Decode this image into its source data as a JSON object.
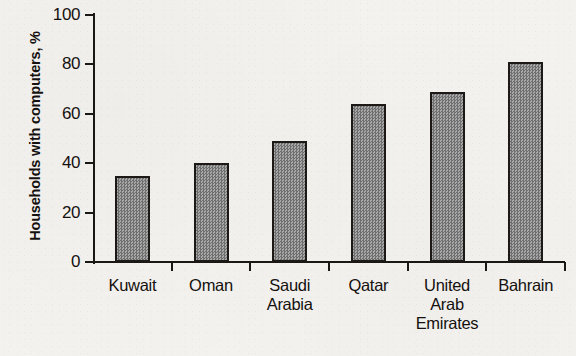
{
  "chart_data": {
    "type": "bar",
    "title": "",
    "xlabel": "",
    "ylabel": "Households with computers, %",
    "categories": [
      "Kuwait",
      "Oman",
      "Saudi Arabia",
      "Qatar",
      "United Arab Emirates",
      "Bahrain"
    ],
    "category_lines": [
      [
        "Kuwait"
      ],
      [
        "Oman"
      ],
      [
        "Saudi",
        "Arabia"
      ],
      [
        "Qatar"
      ],
      [
        "United",
        "Arab",
        "Emirates"
      ],
      [
        "Bahrain"
      ]
    ],
    "values": [
      35,
      40,
      49,
      64,
      69,
      81
    ],
    "ylim": [
      0,
      100
    ],
    "ytick_labels": [
      "100",
      "80",
      "60",
      "40",
      "20",
      "0"
    ],
    "ytick_values": [
      100,
      80,
      60,
      40,
      20,
      0
    ],
    "grid": false,
    "legend": null,
    "legend_position": "none",
    "bar_fill_color": "#8b8b8b",
    "bar_edge_color": "#1d1917",
    "axis_color": "#1b1715",
    "background_color": "#f4f2ef",
    "text_color": "#15110f"
  }
}
